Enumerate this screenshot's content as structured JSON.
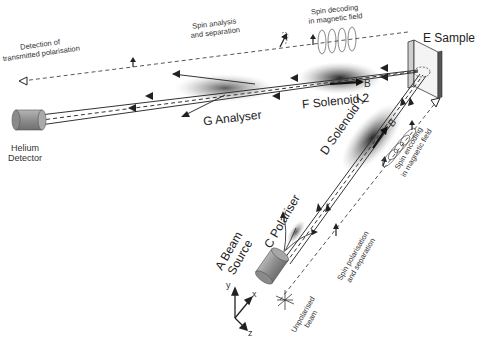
{
  "diagram": {
    "components": [
      {
        "letter": "A",
        "name": "Beam Source",
        "line1": "A Beam",
        "line2": "Source"
      },
      {
        "letter": "C",
        "name": "Polariser",
        "label": "C Polariser"
      },
      {
        "letter": "D",
        "name": "Solenoid 1",
        "label": "D Solenoid 1"
      },
      {
        "letter": "E",
        "name": "Sample",
        "label": "E Sample"
      },
      {
        "letter": "F",
        "name": "Solenoid 2",
        "label": "F Solenoid 2"
      },
      {
        "letter": "G",
        "name": "Analyser",
        "label": "G Analyser"
      },
      {
        "letter": "",
        "name": "Helium Detector",
        "line1": "Helium",
        "line2": "Detector"
      }
    ],
    "field_labels": {
      "b_incoming": "B",
      "b_outgoing": "B"
    },
    "annotations": {
      "detection": {
        "line1": "Detection of",
        "line2": "transmitted polarisation"
      },
      "spin_analysis": {
        "line1": "Spin analysis",
        "line2": "and separation"
      },
      "spin_decoding": {
        "line1": "Spin decoding",
        "line2": "in magnetic field"
      },
      "spin_encoding": {
        "line1": "Spin encoding",
        "line2": "in magnetic field"
      },
      "spin_polarisation": {
        "line1": "Spin polarisation",
        "line2": "and separation"
      },
      "unpolarised": {
        "line1": "Unpolarised",
        "line2": "beam"
      }
    },
    "axes": {
      "x": "x",
      "y": "y",
      "z": "z"
    },
    "colors": {
      "line": "#333333",
      "dashed": "#444444",
      "solenoid_shade": "#555555",
      "cylinder": "#9a9a9a",
      "background": "#ffffff"
    }
  }
}
